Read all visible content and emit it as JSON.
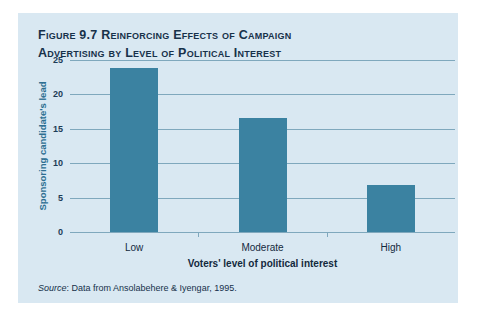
{
  "figure": {
    "number_label": "Figure 9.7",
    "title": "Reinforcing Effects of Campaign Advertising by Level of Political Interest",
    "title_line1": "Figure 9.7 Reinforcing Effects of Campaign",
    "title_line2": "Advertising by Level of Political Interest",
    "source_prefix": "Source",
    "source_separator": ": ",
    "source_text": "Data from Ansolabehere & Iyengar, 1995."
  },
  "colors": {
    "panel_background": "#d9e8f2",
    "bar_fill": "#3b82a1",
    "gridline": "#7fa8bd",
    "axis_title_y": "#2d6f91",
    "axis_title_x": "#13293d",
    "title_text": "#17314a"
  },
  "chart_data": {
    "type": "bar",
    "title": "Figure 9.7 Reinforcing Effects of Campaign Advertising by Level of Political Interest",
    "categories": [
      "Low",
      "Moderate",
      "High"
    ],
    "values": [
      23.8,
      16.5,
      6.8
    ],
    "series": [
      {
        "name": "Sponsoring candidate's lead",
        "values": [
          23.8,
          16.5,
          6.8
        ]
      }
    ],
    "xlabel": "Voters' level of political interest",
    "ylabel": "Sponsoring candidate's lead",
    "ylim": [
      0,
      25
    ],
    "yticks": [
      0,
      5,
      10,
      15,
      20,
      25
    ],
    "ytick_labels": [
      "0",
      "5",
      "10",
      "15",
      "20",
      "25"
    ],
    "grid": true,
    "gridlines": "horizontal",
    "legend": false,
    "source": "Source: Data from Ansolabehere & Iyengar, 1995."
  }
}
